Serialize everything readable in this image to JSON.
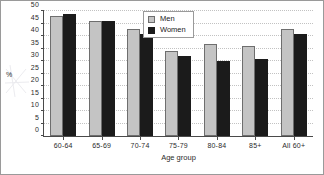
{
  "chart_data": {
    "type": "bar",
    "title": "",
    "subtitle": "",
    "xlabel": "Age group",
    "ylabel": "%",
    "categories": [
      "60-64",
      "65-69",
      "70-74",
      "75-79",
      "80-84",
      "85+",
      "All 60+"
    ],
    "series": [
      {
        "name": "Men",
        "color": "#c4c4c4",
        "values": [
          48,
          46,
          43,
          34,
          37,
          36,
          43
        ]
      },
      {
        "name": "Women",
        "color": "#1b1b1b",
        "values": [
          49,
          46,
          41,
          32,
          30,
          31,
          41
        ]
      }
    ],
    "ylim": [
      0,
      50
    ],
    "ytick_step": 5,
    "ytick_labels": [
      "0",
      "5",
      "10",
      "15",
      "20",
      "25",
      "30",
      "35",
      "40",
      "45",
      "50"
    ],
    "grid": true,
    "grid_axis": "y",
    "legend_position": "top-center",
    "annotations": []
  },
  "legend": {
    "items": [
      {
        "label": "Men"
      },
      {
        "label": "Women"
      }
    ]
  },
  "colors": {
    "men_fill": "#c4c4c4",
    "women_fill": "#1b1b1b",
    "axis": "#4a4a4a",
    "grid": "#c2c2c2",
    "frame": "#9a9a9a",
    "background": "#ffffff"
  }
}
